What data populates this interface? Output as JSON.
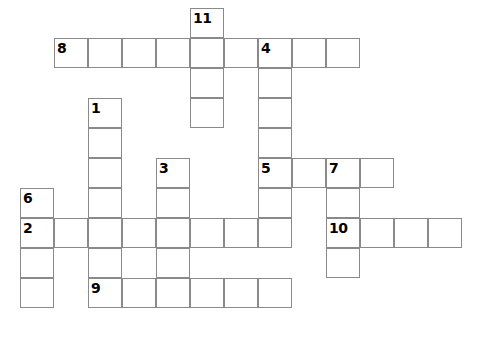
{
  "puzzle": {
    "title": "Crossword Grid",
    "canvas": {
      "width": 499,
      "height": 339,
      "background": "#ffffff"
    },
    "geometry": {
      "cell_width": 34,
      "cell_height": 30,
      "origin_x": 20,
      "origin_y": 8,
      "line_color": "#8a8a8a",
      "number_color": "#000000"
    },
    "entries": [
      {
        "number": "11",
        "direction": "down",
        "col": 5,
        "row": 0,
        "length": 4,
        "x": 190,
        "y": 8
      },
      {
        "number": "8",
        "direction": "across",
        "col": 1,
        "row": 1,
        "length": 8,
        "x": 54,
        "y": 38
      },
      {
        "number": "4",
        "direction": "down",
        "col": 7,
        "row": 1,
        "length": 5,
        "x": 258,
        "y": 38
      },
      {
        "number": "1",
        "direction": "down",
        "col": 2,
        "row": 3,
        "length": 8,
        "x": 88,
        "y": 98
      },
      {
        "number": "3",
        "direction": "down",
        "col": 4,
        "row": 5,
        "length": 5,
        "x": 156,
        "y": 158
      },
      {
        "number": "5",
        "direction": "across",
        "col": 7,
        "row": 5,
        "length": 4,
        "x": 258,
        "y": 158
      },
      {
        "number": "7",
        "direction": "down",
        "col": 9,
        "row": 5,
        "length": 5,
        "x": 326,
        "y": 158
      },
      {
        "number": "6",
        "direction": "down",
        "col": 0,
        "row": 6,
        "length": 4,
        "x": 20,
        "y": 188
      },
      {
        "number": "2",
        "direction": "across",
        "col": 0,
        "row": 7,
        "length": 8,
        "x": 20,
        "y": 218
      },
      {
        "number": "10",
        "direction": "across",
        "col": 9,
        "row": 7,
        "length": 4,
        "x": 326,
        "y": 218
      },
      {
        "number": "9",
        "direction": "across",
        "col": 2,
        "row": 9,
        "length": 6,
        "x": 88,
        "y": 278
      }
    ],
    "cells": [
      {
        "x": 190,
        "y": 8,
        "number": "11"
      },
      {
        "x": 190,
        "y": 38,
        "number": null
      },
      {
        "x": 190,
        "y": 68,
        "number": null
      },
      {
        "x": 190,
        "y": 98,
        "number": null
      },
      {
        "x": 54,
        "y": 38,
        "number": "8"
      },
      {
        "x": 88,
        "y": 38,
        "number": null
      },
      {
        "x": 122,
        "y": 38,
        "number": null
      },
      {
        "x": 156,
        "y": 38,
        "number": null
      },
      {
        "x": 224,
        "y": 38,
        "number": null
      },
      {
        "x": 258,
        "y": 38,
        "number": "4"
      },
      {
        "x": 292,
        "y": 38,
        "number": null
      },
      {
        "x": 326,
        "y": 38,
        "number": null
      },
      {
        "x": 258,
        "y": 68,
        "number": null
      },
      {
        "x": 258,
        "y": 98,
        "number": null
      },
      {
        "x": 258,
        "y": 128,
        "number": null
      },
      {
        "x": 88,
        "y": 98,
        "number": "1"
      },
      {
        "x": 88,
        "y": 128,
        "number": null
      },
      {
        "x": 88,
        "y": 158,
        "number": null
      },
      {
        "x": 88,
        "y": 188,
        "number": null
      },
      {
        "x": 88,
        "y": 248,
        "number": null
      },
      {
        "x": 156,
        "y": 158,
        "number": "3"
      },
      {
        "x": 156,
        "y": 188,
        "number": null
      },
      {
        "x": 156,
        "y": 248,
        "number": null
      },
      {
        "x": 258,
        "y": 158,
        "number": "5"
      },
      {
        "x": 292,
        "y": 158,
        "number": null
      },
      {
        "x": 326,
        "y": 158,
        "number": "7"
      },
      {
        "x": 360,
        "y": 158,
        "number": null
      },
      {
        "x": 258,
        "y": 188,
        "number": null
      },
      {
        "x": 326,
        "y": 188,
        "number": null
      },
      {
        "x": 326,
        "y": 248,
        "number": null
      },
      {
        "x": 20,
        "y": 188,
        "number": "6"
      },
      {
        "x": 20,
        "y": 248,
        "number": null
      },
      {
        "x": 20,
        "y": 278,
        "number": null
      },
      {
        "x": 20,
        "y": 218,
        "number": "2"
      },
      {
        "x": 54,
        "y": 218,
        "number": null
      },
      {
        "x": 88,
        "y": 218,
        "number": null
      },
      {
        "x": 122,
        "y": 218,
        "number": null
      },
      {
        "x": 156,
        "y": 218,
        "number": null
      },
      {
        "x": 190,
        "y": 218,
        "number": null
      },
      {
        "x": 224,
        "y": 218,
        "number": null
      },
      {
        "x": 258,
        "y": 218,
        "number": null
      },
      {
        "x": 326,
        "y": 218,
        "number": "10"
      },
      {
        "x": 360,
        "y": 218,
        "number": null
      },
      {
        "x": 394,
        "y": 218,
        "number": null
      },
      {
        "x": 428,
        "y": 218,
        "number": null
      },
      {
        "x": 88,
        "y": 278,
        "number": "9"
      },
      {
        "x": 122,
        "y": 278,
        "number": null
      },
      {
        "x": 156,
        "y": 278,
        "number": null
      },
      {
        "x": 190,
        "y": 278,
        "number": null
      },
      {
        "x": 224,
        "y": 278,
        "number": null
      },
      {
        "x": 258,
        "y": 278,
        "number": null
      }
    ]
  }
}
